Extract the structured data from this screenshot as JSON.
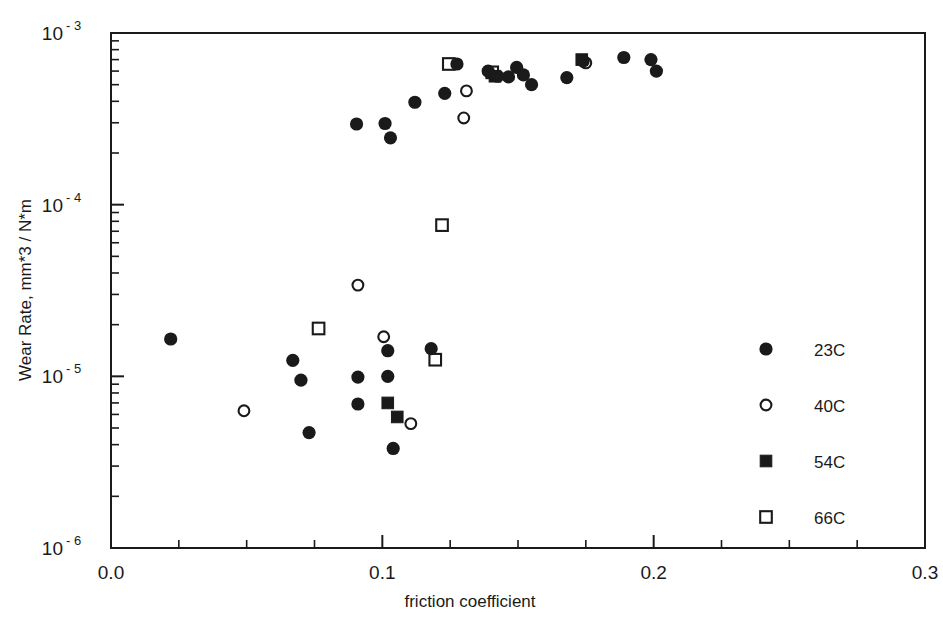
{
  "chart_data": {
    "type": "scatter",
    "title": "",
    "xlabel": "friction coefficient",
    "ylabel": "Wear Rate,  mm*3 / N*m",
    "xlim": [
      0.0,
      0.3
    ],
    "ylim": [
      1e-06,
      0.001
    ],
    "yscale": "log",
    "xscale": "linear",
    "grid": false,
    "legend_position": "right",
    "xticks": [
      "0.0",
      "0.1",
      "0.2",
      "0.3"
    ],
    "xtick_values": [
      0.0,
      0.1,
      0.2,
      0.3
    ],
    "xminor_step": 0.025,
    "yticks": [
      {
        "mantissa": "10",
        "exponent": "- 3",
        "value": 0.001
      },
      {
        "mantissa": "10",
        "exponent": "- 4",
        "value": 0.0001
      },
      {
        "mantissa": "10",
        "exponent": "- 5",
        "value": 1e-05
      },
      {
        "mantissa": "10",
        "exponent": "- 6",
        "value": 1e-06
      }
    ],
    "series": [
      {
        "name": "23C",
        "marker": "filled-circle",
        "color": "#1a1a1a",
        "points": [
          [
            0.022,
            1.65e-05
          ],
          [
            0.067,
            1.24e-05
          ],
          [
            0.07,
            9.5e-06
          ],
          [
            0.073,
            4.7e-06
          ],
          [
            0.091,
            9.9e-06
          ],
          [
            0.091,
            6.9e-06
          ],
          [
            0.0905,
            0.000295
          ],
          [
            0.101,
            0.000297
          ],
          [
            0.103,
            0.000245
          ],
          [
            0.102,
            1.41e-05
          ],
          [
            0.102,
            1e-05
          ],
          [
            0.104,
            3.8e-06
          ],
          [
            0.112,
            0.000395
          ],
          [
            0.118,
            1.45e-05
          ],
          [
            0.123,
            0.000445
          ],
          [
            0.1275,
            0.00066
          ],
          [
            0.139,
            0.0006
          ],
          [
            0.1425,
            0.00056
          ],
          [
            0.1465,
            0.000555
          ],
          [
            0.1495,
            0.00063
          ],
          [
            0.152,
            0.00057
          ],
          [
            0.155,
            0.0005
          ],
          [
            0.168,
            0.00055
          ],
          [
            0.174,
            0.000685
          ],
          [
            0.189,
            0.00072
          ],
          [
            0.199,
            0.0007
          ],
          [
            0.201,
            0.0006
          ]
        ]
      },
      {
        "name": "40C",
        "marker": "open-circle",
        "color": "#1a1a1a",
        "points": [
          [
            0.049,
            6.3e-06
          ],
          [
            0.091,
            3.4e-05
          ],
          [
            0.1005,
            1.7e-05
          ],
          [
            0.1105,
            5.3e-06
          ],
          [
            0.13,
            0.00032
          ],
          [
            0.131,
            0.00046
          ],
          [
            0.175,
            0.00067
          ]
        ]
      },
      {
        "name": "54C",
        "marker": "filled-square",
        "color": "#1a1a1a",
        "points": [
          [
            0.102,
            7e-06
          ],
          [
            0.1055,
            5.8e-06
          ],
          [
            0.1415,
            0.00056
          ],
          [
            0.1735,
            0.0007
          ]
        ]
      },
      {
        "name": "66C",
        "marker": "open-square",
        "color": "#1a1a1a",
        "points": [
          [
            0.0765,
            1.9e-05
          ],
          [
            0.1195,
            1.25e-05
          ],
          [
            0.122,
            7.6e-05
          ],
          [
            0.1245,
            0.00066
          ],
          [
            0.1405,
            0.00059
          ]
        ]
      }
    ]
  },
  "legend": {
    "entries": [
      {
        "label": "23C",
        "marker": "filled-circle"
      },
      {
        "label": "40C",
        "marker": "open-circle"
      },
      {
        "label": "54C",
        "marker": "filled-square"
      },
      {
        "label": "66C",
        "marker": "open-square"
      }
    ]
  }
}
